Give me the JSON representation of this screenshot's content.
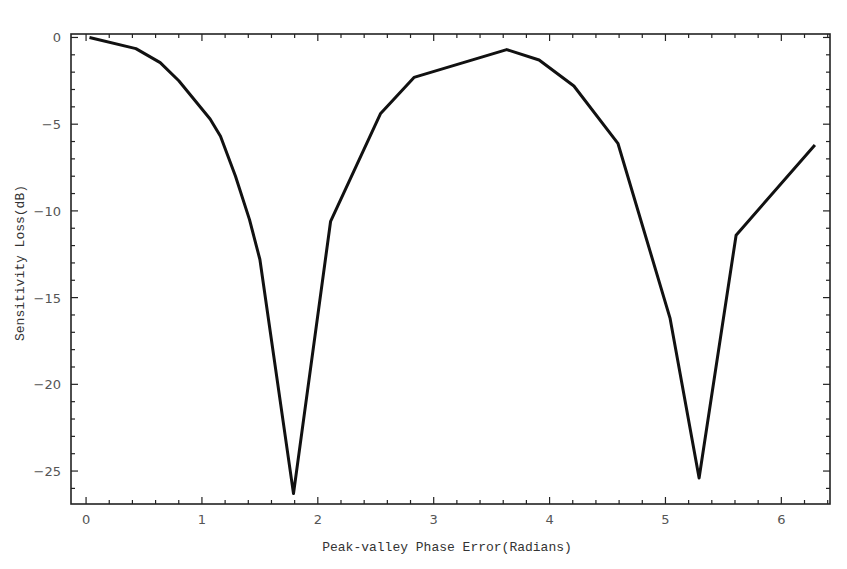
{
  "chart_data": {
    "type": "line",
    "title": "",
    "xlabel": "Peak-valley Phase Error(Radians)",
    "ylabel": "Sensitivity Loss(dB)",
    "xlim": [
      -0.13,
      6.42
    ],
    "ylim": [
      -26.9,
      0.2
    ],
    "xticks": [
      0,
      1,
      2,
      3,
      4,
      5,
      6
    ],
    "yticks": [
      0,
      -5,
      -10,
      -15,
      -20,
      -25
    ],
    "grid": false,
    "legend": null,
    "series": [
      {
        "name": "Sensitivity Loss",
        "color": "#111111",
        "x": [
          0.03,
          0.43,
          0.64,
          0.8,
          1.07,
          1.16,
          1.29,
          1.41,
          1.5,
          1.79,
          2.11,
          2.54,
          2.83,
          3.63,
          3.91,
          4.21,
          4.59,
          5.04,
          5.29,
          5.61,
          6.29
        ],
        "y": [
          0.0,
          -0.64,
          -1.45,
          -2.5,
          -4.7,
          -5.7,
          -8.0,
          -10.5,
          -12.8,
          -26.3,
          -10.6,
          -4.4,
          -2.3,
          -0.7,
          -1.3,
          -2.8,
          -6.1,
          -16.2,
          -25.4,
          -11.4,
          -6.2
        ]
      }
    ]
  }
}
